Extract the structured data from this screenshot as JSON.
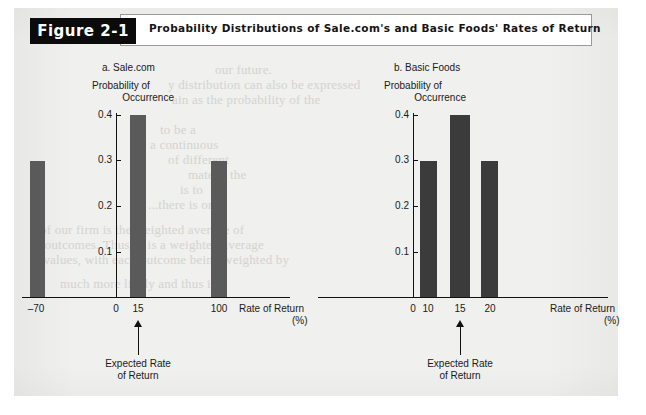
{
  "figure": {
    "badge": "Figure 2-1",
    "title": "Probability Distributions of Sale.com's and Basic Foods' Rates of Return"
  },
  "colors": {
    "paper": "#f0f0ee",
    "bar_a": "#5a5a5a",
    "bar_b": "#3b3b3b",
    "axis": "#111111",
    "banner_bg": "#0b0b0b",
    "banner_text": "#ffffff"
  },
  "ghost_text": [
    {
      "text": "our future.",
      "x": 215,
      "y": 62
    },
    {
      "text": "y distribution can also be expressed",
      "x": 168,
      "y": 77
    },
    {
      "text": "ain as the probability of the",
      "x": 172,
      "y": 92
    },
    {
      "text": "to be a",
      "x": 160,
      "y": 122
    },
    {
      "text": "a continuous",
      "x": 150,
      "y": 137
    },
    {
      "text": "of different",
      "x": 168,
      "y": 152
    },
    {
      "text": "mate is the",
      "x": 188,
      "y": 167
    },
    {
      "text": "is to",
      "x": 180,
      "y": 182
    },
    {
      "text": "...there is only",
      "x": 148,
      "y": 197
    },
    {
      "text": "of our firm is the weighted average of",
      "x": 40,
      "y": 222
    },
    {
      "text": "s outcomes. Thus, it is a weighted average",
      "x": 36,
      "y": 237
    },
    {
      "text": "e values, with each outcome being weighted by",
      "x": 34,
      "y": 252
    },
    {
      "text": "much more likely and thus it is",
      "x": 60,
      "y": 276
    }
  ],
  "charts": [
    {
      "id": "a",
      "panel_label": "a. Sale.com",
      "y_axis_title_line1": "Probability of",
      "y_axis_title_line2": "Occurrence",
      "x_axis_name": "Rate of Return",
      "x_axis_unit": "(%)",
      "y_ticks": [
        "0.4",
        "0.3",
        "0.2",
        "0.1"
      ],
      "x_ticks": [
        "–70",
        "0",
        "15",
        "100"
      ],
      "annotation_line1": "Expected Rate",
      "annotation_line2": "of Return",
      "annotation_at": "15",
      "chart_data": {
        "type": "bar",
        "title": "a. Sale.com",
        "xlabel": "Rate of Return (%)",
        "ylabel": "Probability of Occurrence",
        "categories": [
          "-70",
          "15",
          "100"
        ],
        "values": [
          0.3,
          0.4,
          0.3
        ],
        "ylim": [
          0,
          0.45
        ],
        "yticks": [
          0.1,
          0.2,
          0.3,
          0.4
        ],
        "xticks": [
          -70,
          0,
          15,
          100
        ],
        "grid": false,
        "legend": "none",
        "expected_rate_of_return": 15
      }
    },
    {
      "id": "b",
      "panel_label": "b. Basic Foods",
      "y_axis_title_line1": "Probability of",
      "y_axis_title_line2": "Occurrence",
      "x_axis_name": "Rate of Return",
      "x_axis_unit": "(%)",
      "y_ticks": [
        "0.4",
        "0.3",
        "0.2",
        "0.1"
      ],
      "x_ticks": [
        "0",
        "10",
        "15",
        "20"
      ],
      "annotation_line1": "Expected Rate",
      "annotation_line2": "of Return",
      "annotation_at": "15",
      "chart_data": {
        "type": "bar",
        "title": "b. Basic Foods",
        "xlabel": "Rate of Return (%)",
        "ylabel": "Probability of Occurrence",
        "categories": [
          "10",
          "15",
          "20"
        ],
        "values": [
          0.3,
          0.4,
          0.3
        ],
        "ylim": [
          0,
          0.45
        ],
        "yticks": [
          0.1,
          0.2,
          0.3,
          0.4
        ],
        "xticks": [
          0,
          10,
          15,
          20
        ],
        "grid": false,
        "legend": "none",
        "expected_rate_of_return": 15
      }
    }
  ]
}
